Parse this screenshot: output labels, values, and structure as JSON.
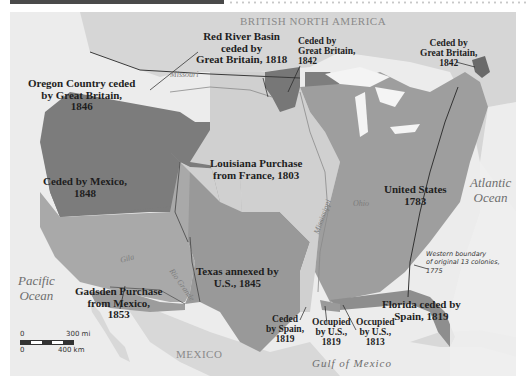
{
  "header": {
    "title_bar": "",
    "style": "dark bar with dotted rule"
  },
  "map": {
    "colors": {
      "background": "#e9e9e9",
      "original_us": "#9d9d9d",
      "louisiana": "#d0d0d0",
      "oregon": "#7c7c7c",
      "mexico_cession": "#a8a8a8",
      "texas": "#9a9a9a",
      "red_river": "#7a7a7a",
      "ceded_1842": "#7e7e7e",
      "florida": "#8f8f8f",
      "gadsden": "#a0a0a0",
      "foreign_land": "#d9d9d9",
      "water": "#f2f2f2"
    },
    "regions": [
      {
        "id": "red-river",
        "label": "Red River Basin\nceded by\nGreat Britain, 1818"
      },
      {
        "id": "ceded-1842-west",
        "label": "Ceded by\nGreat Britain,\n1842"
      },
      {
        "id": "ceded-1842-east",
        "label": "Ceded by\nGreat Britain,\n1842"
      },
      {
        "id": "oregon",
        "label": "Oregon Country ceded\nby Great Britain,\n1846"
      },
      {
        "id": "louisiana",
        "label": "Louisiana Purchase\nfrom France, 1803"
      },
      {
        "id": "mexico-cession",
        "label": "Ceded by Mexico,\n1848"
      },
      {
        "id": "united-states",
        "label": "United States\n1783"
      },
      {
        "id": "texas",
        "label": "Texas annexed by\nU.S., 1845"
      },
      {
        "id": "gadsden",
        "label": "Gadsden Purchase\nfrom Mexico,\n1853"
      },
      {
        "id": "ceded-spain-1819",
        "label": "Ceded\nby Spain,\n1819"
      },
      {
        "id": "occupied-1819",
        "label": "Occupied\nby U.S.,\n1819"
      },
      {
        "id": "occupied-1813",
        "label": "Occupied\nby U.S.,\n1813"
      },
      {
        "id": "florida",
        "label": "Florida ceded by\nSpain, 1819"
      }
    ],
    "place_labels": {
      "british_north_america": "BRITISH NORTH AMERICA",
      "mexico": "MEXICO"
    },
    "oceans": {
      "atlantic": "Atlantic\nOcean",
      "pacific": "Pacific\nOcean",
      "gulf": "Gulf of Mexico"
    },
    "rivers": {
      "missouri": "Missouri",
      "ohio": "Ohio",
      "mississippi": "Mississippi",
      "gila": "Gila",
      "rio_grande": "Rio Grande"
    },
    "annotation": "Western boundary\nof original 13 colonies,\n1775",
    "scale_bar": {
      "mi_start": "0",
      "mi_end": "300 mi",
      "km_start": "0",
      "km_end": "400 km"
    }
  }
}
